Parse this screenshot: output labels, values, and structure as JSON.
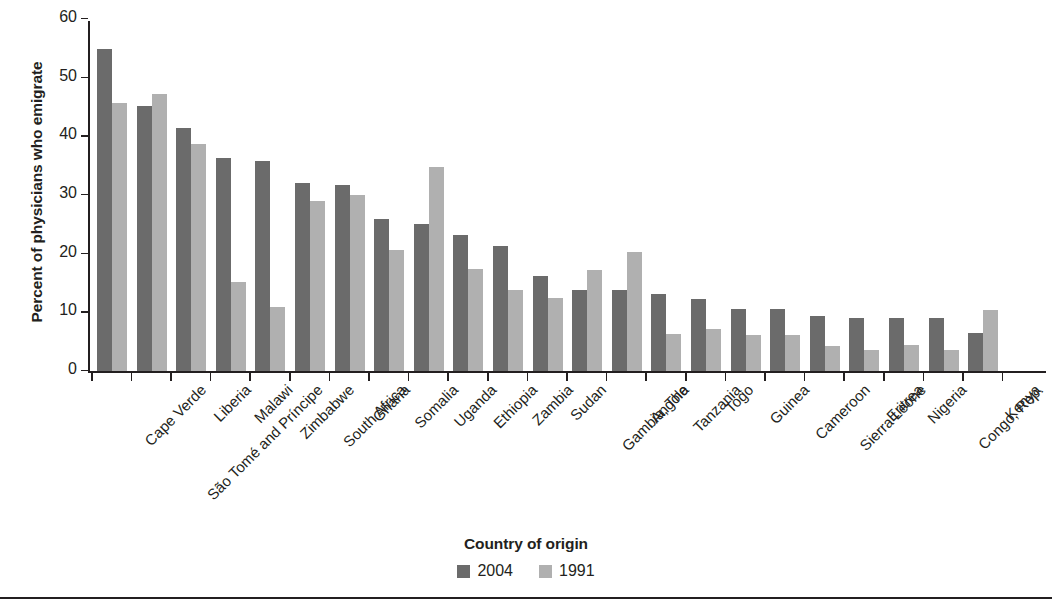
{
  "chart_data": {
    "type": "bar",
    "title": "",
    "xlabel": "Country of origin",
    "ylabel": "Percent of physicians who emigrate",
    "ylim": [
      0,
      60
    ],
    "yticks": [
      0,
      10,
      20,
      30,
      40,
      50,
      60
    ],
    "grid": false,
    "legend_position": "bottom",
    "legend_title": "Country of origin",
    "categories": [
      "Cape Verde",
      "São Tomé and Príncipe",
      "Liberia",
      "Malawi",
      "Zimbabwe",
      "South Africa",
      "Ghana",
      "Somalia",
      "Uganda",
      "Ethiopia",
      "Zambia",
      "Sudan",
      "Gambia, The",
      "Angola",
      "Tanzania",
      "Togo",
      "Guinea",
      "Cameroon",
      "Sierra Leone",
      "Eritrea",
      "Nigeria",
      "Congo, Rep.",
      "Kenya"
    ],
    "series": [
      {
        "name": "2004",
        "color": "#6b6b6b",
        "values": [
          55.0,
          45.2,
          41.5,
          36.3,
          35.9,
          32.1,
          31.7,
          26.0,
          25.1,
          23.3,
          21.3,
          16.3,
          13.8,
          13.8,
          13.2,
          12.3,
          10.7,
          10.7,
          9.5,
          9.1,
          9.1,
          9.1,
          6.5
        ]
      },
      {
        "name": "1991",
        "color": "#b0b0b0",
        "values": [
          45.7,
          47.3,
          38.7,
          15.3,
          11.0,
          29.0,
          30.0,
          20.7,
          34.9,
          17.5,
          13.8,
          12.5,
          17.3,
          20.3,
          6.3,
          7.2,
          6.2,
          6.2,
          4.4,
          3.6,
          4.5,
          3.7,
          10.5
        ]
      }
    ]
  },
  "legend": {
    "title": "Country of origin",
    "items": [
      {
        "label": "2004",
        "color": "#6b6b6b"
      },
      {
        "label": "1991",
        "color": "#b0b0b0"
      }
    ]
  },
  "axes": {
    "y_title": "Percent of physicians who emigrate"
  }
}
